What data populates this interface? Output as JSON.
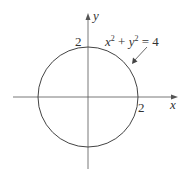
{
  "diagram": {
    "axes": {
      "x_label": "x",
      "y_label": "y"
    },
    "ticks": {
      "x_intercept": "2",
      "y_intercept": "2"
    },
    "equation": {
      "lhs_x": "x",
      "exp1": "2",
      "plus": " + ",
      "lhs_y": "y",
      "exp2": "2",
      "rhs": " = 4"
    },
    "circle": {
      "center": [
        0,
        0
      ],
      "radius": 2
    },
    "colors": {
      "stroke": "#444444",
      "background": "#ffffff"
    }
  }
}
